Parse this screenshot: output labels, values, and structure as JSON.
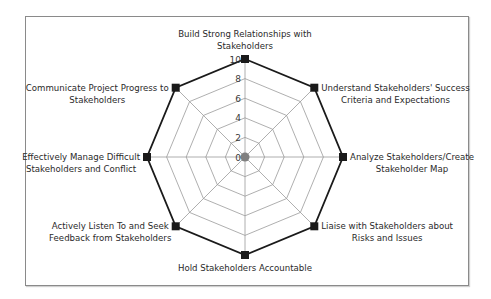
{
  "chart_data": {
    "type": "radar",
    "title": "",
    "axes": [
      {
        "label_lines": [
          "Build Strong Relationships with",
          "Stakeholders"
        ],
        "value": 10
      },
      {
        "label_lines": [
          "Understand Stakeholders' Success",
          "Criteria and Expectations"
        ],
        "value": 10
      },
      {
        "label_lines": [
          "Analyze Stakeholders/Create",
          "Stakeholder Map"
        ],
        "value": 10
      },
      {
        "label_lines": [
          "Liaise with Stakeholders about",
          "Risks and Issues"
        ],
        "value": 10
      },
      {
        "label_lines": [
          "Hold Stakeholders Accountable"
        ],
        "value": 10
      },
      {
        "label_lines": [
          "Actively Listen To and Seek",
          "Feedback from Stakeholders"
        ],
        "value": 10
      },
      {
        "label_lines": [
          "Effectively Manage Difficult",
          "Stakeholders and Conflict"
        ],
        "value": 10
      },
      {
        "label_lines": [
          "Communicate Project Progress to",
          "Stakeholders"
        ],
        "value": 10
      }
    ],
    "categories": [
      "Build Strong Relationships with Stakeholders",
      "Understand Stakeholders' Success Criteria and Expectations",
      "Analyze Stakeholders/Create Stakeholder Map",
      "Liaise with Stakeholders about Risks and Issues",
      "Hold Stakeholders Accountable",
      "Actively Listen To and Seek Feedback from Stakeholders",
      "Effectively Manage Difficult Stakeholders and Conflict",
      "Communicate Project Progress to Stakeholders"
    ],
    "series": [
      {
        "name": "Score",
        "values": [
          10,
          10,
          10,
          10,
          10,
          10,
          10,
          10
        ]
      }
    ],
    "scale": {
      "min": 0,
      "max": 10,
      "ticks": [
        0,
        2,
        4,
        6,
        8,
        10
      ]
    },
    "grid": true,
    "legend": null,
    "colors": {
      "series_line": "#1a1a1a",
      "marker": "#1a1a1a",
      "grid": "#9a9a9a",
      "center_dot": "#808080",
      "frame": "#8a8a8a"
    }
  }
}
